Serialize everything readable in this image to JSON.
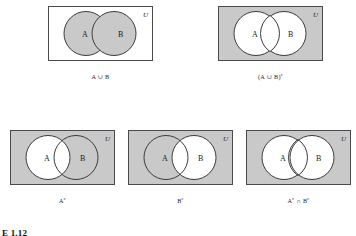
{
  "figure": {
    "number_label": "E 1.12",
    "universe_symbol": "U",
    "set_a_label": "A",
    "set_b_label": "B",
    "colors": {
      "shade": "#c9c9c9",
      "outline": "#3b3b3b",
      "rect_outline": "#4a4a4a",
      "text": "#242424",
      "background": "#ffffff"
    },
    "diagrams": [
      {
        "id": "a-union-b",
        "caption": "A ∪ B",
        "caption_base": "A ∪ B",
        "caption_sup": "",
        "rect_shaded": false,
        "circle_a_shaded": true,
        "circle_b_shaded": true,
        "row": 1,
        "col": 1
      },
      {
        "id": "a-union-b-complement",
        "caption": "(A ∪ B)c",
        "caption_base": "(A ∪ B)",
        "caption_sup": "c",
        "rect_shaded": true,
        "circle_a_shaded": false,
        "circle_b_shaded": false,
        "row": 1,
        "col": 2
      },
      {
        "id": "a-complement",
        "caption": "Ac",
        "caption_base": "A",
        "caption_sup": "c",
        "rect_shaded": true,
        "circle_a_shaded": false,
        "circle_b_shaded": true,
        "row": 2,
        "col": 1
      },
      {
        "id": "b-complement",
        "caption": "Bc",
        "caption_base": "B",
        "caption_sup": "c",
        "rect_shaded": true,
        "circle_a_shaded": true,
        "circle_b_shaded": false,
        "row": 2,
        "col": 2
      },
      {
        "id": "a-complement-intersect-b-complement",
        "caption": "Ac ∩ Bc",
        "caption_base": "A",
        "caption_sup": "c",
        "caption_mid": " ∩ B",
        "caption_sup2": "c",
        "rect_shaded": true,
        "circle_a_shaded": false,
        "circle_b_shaded": false,
        "row": 2,
        "col": 3
      }
    ]
  }
}
